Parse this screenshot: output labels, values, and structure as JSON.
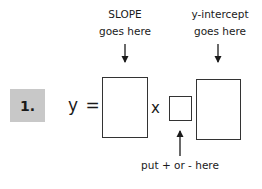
{
  "problem": {
    "number_label": "1.",
    "equation_lhs": "y =",
    "operator": "x"
  },
  "annotations": {
    "slope": {
      "line1": "SLOPE",
      "line2": "goes here"
    },
    "intercept": {
      "line1": "y-intercept",
      "line2": "goes here"
    },
    "sign": {
      "text": "put + or - here"
    }
  },
  "colors": {
    "label_bg": "#c8c8c8",
    "box_border": "#333333",
    "text": "#1a1a1a"
  }
}
